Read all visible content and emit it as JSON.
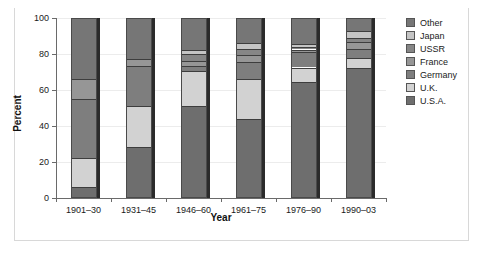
{
  "chart_data": {
    "type": "bar",
    "subtype": "stacked-percentage",
    "title": "",
    "xlabel": "Year",
    "ylabel": "Percent",
    "ylim": [
      0,
      100
    ],
    "yticks": [
      0,
      20,
      40,
      60,
      80,
      100
    ],
    "grid": true,
    "legend_position": "right",
    "categories": [
      "1901–30",
      "1931–45",
      "1946–60",
      "1961–75",
      "1976–90",
      "1990–03"
    ],
    "series": [
      {
        "name": "U.S.A.",
        "color": "#6e6e6e",
        "values": [
          6,
          28.5,
          51,
          44,
          64.5,
          72
        ]
      },
      {
        "name": "U.K.",
        "color": "#d2d2d2",
        "values": [
          16,
          22.5,
          19.5,
          22,
          8,
          6
        ]
      },
      {
        "name": "Germany",
        "color": "#7e7e7e",
        "values": [
          33,
          22.5,
          3,
          9.5,
          8.5,
          5
        ]
      },
      {
        "name": "France",
        "color": "#969696",
        "values": [
          11,
          3.5,
          2.5,
          4,
          1.5,
          3.5
        ]
      },
      {
        "name": "USSR",
        "color": "#868686",
        "values": [
          0,
          0,
          4,
          3.5,
          1.5,
          2.5
        ]
      },
      {
        "name": "Japan",
        "color": "#c4c4c4",
        "values": [
          0,
          0,
          2.5,
          3,
          1.5,
          4
        ]
      },
      {
        "name": "Other",
        "color": "#767676",
        "values": [
          34,
          23,
          17.5,
          14,
          14.5,
          7
        ]
      }
    ]
  },
  "legend": {
    "entries": [
      {
        "label": "Other",
        "color": "#767676"
      },
      {
        "label": "Japan",
        "color": "#c4c4c4"
      },
      {
        "label": "USSR",
        "color": "#868686"
      },
      {
        "label": "France",
        "color": "#969696"
      },
      {
        "label": "Germany",
        "color": "#7e7e7e"
      },
      {
        "label": "U.K.",
        "color": "#d2d2d2"
      },
      {
        "label": "U.S.A.",
        "color": "#6e6e6e"
      }
    ]
  }
}
